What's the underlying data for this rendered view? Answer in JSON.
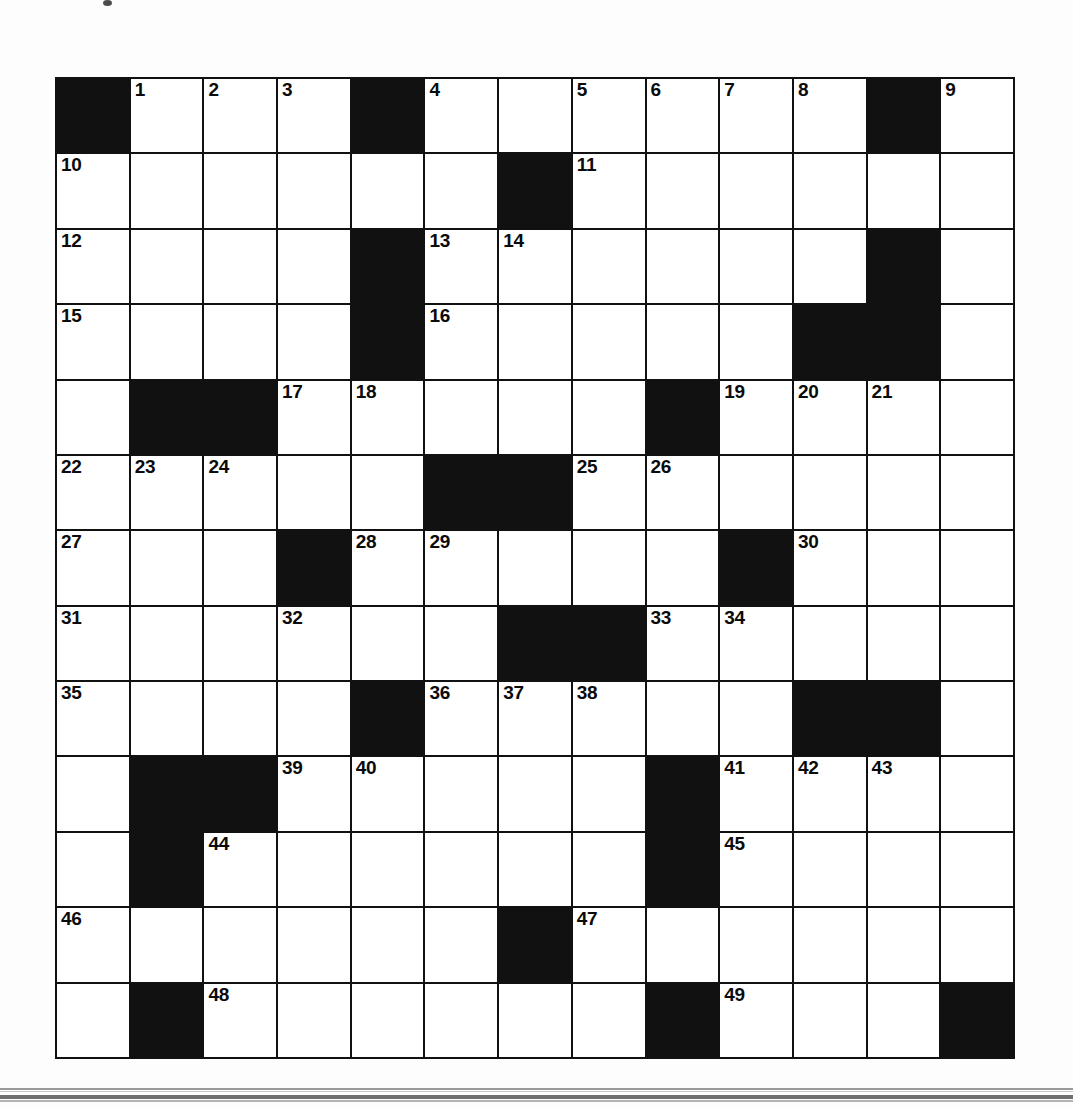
{
  "page": {
    "kind": "crossword-puzzle-grid",
    "background_color": "#fdfdfd"
  },
  "crossword": {
    "rows": 13,
    "columns": 13,
    "block_color": "#111111",
    "cell_color": "#ffffff",
    "line_color": "#111111",
    "highest_clue_number": 49,
    "grid": [
      [
        {
          "block": true
        },
        {
          "number": "1"
        },
        {
          "number": "2"
        },
        {
          "number": "3"
        },
        {
          "block": true
        },
        {
          "number": "4"
        },
        {},
        {
          "number": "5"
        },
        {
          "number": "6"
        },
        {
          "number": "7"
        },
        {
          "number": "8"
        },
        {
          "block": true
        },
        {
          "number": "9"
        }
      ],
      [
        {
          "number": "10"
        },
        {},
        {},
        {},
        {},
        {},
        {
          "block": true
        },
        {
          "number": "11"
        },
        {},
        {},
        {},
        {},
        {}
      ],
      [
        {
          "number": "12"
        },
        {},
        {},
        {},
        {
          "block": true
        },
        {
          "number": "13"
        },
        {
          "number": "14"
        },
        {},
        {},
        {},
        {},
        {
          "block": true
        },
        {}
      ],
      [
        {
          "number": "15"
        },
        {},
        {},
        {},
        {
          "block": true
        },
        {
          "number": "16"
        },
        {},
        {},
        {},
        {},
        {
          "block": true
        },
        {
          "block": true
        },
        {}
      ],
      [
        {},
        {
          "block": true
        },
        {
          "block": true
        },
        {
          "number": "17"
        },
        {
          "number": "18"
        },
        {},
        {},
        {},
        {
          "block": true
        },
        {
          "number": "19"
        },
        {
          "number": "20"
        },
        {
          "number": "21"
        },
        {}
      ],
      [
        {
          "number": "22"
        },
        {
          "number": "23"
        },
        {
          "number": "24"
        },
        {},
        {},
        {
          "block": true
        },
        {
          "block": true
        },
        {
          "number": "25"
        },
        {
          "number": "26"
        },
        {},
        {},
        {},
        {}
      ],
      [
        {
          "number": "27"
        },
        {},
        {},
        {
          "block": true
        },
        {
          "number": "28"
        },
        {
          "number": "29"
        },
        {},
        {},
        {},
        {
          "block": true
        },
        {
          "number": "30"
        },
        {},
        {}
      ],
      [
        {
          "number": "31"
        },
        {},
        {},
        {
          "number": "32"
        },
        {},
        {},
        {
          "block": true
        },
        {
          "block": true
        },
        {
          "number": "33"
        },
        {
          "number": "34"
        },
        {},
        {},
        {}
      ],
      [
        {
          "number": "35"
        },
        {},
        {},
        {},
        {
          "block": true
        },
        {
          "number": "36"
        },
        {
          "number": "37"
        },
        {
          "number": "38"
        },
        {},
        {},
        {
          "block": true
        },
        {
          "block": true
        },
        {}
      ],
      [
        {},
        {
          "block": true
        },
        {
          "block": true
        },
        {
          "number": "39"
        },
        {
          "number": "40"
        },
        {},
        {},
        {},
        {
          "block": true
        },
        {
          "number": "41"
        },
        {
          "number": "42"
        },
        {
          "number": "43"
        },
        {}
      ],
      [
        {},
        {
          "block": true
        },
        {
          "number": "44"
        },
        {},
        {},
        {},
        {},
        {},
        {
          "block": true
        },
        {
          "number": "45"
        },
        {},
        {},
        {}
      ],
      [
        {
          "number": "46"
        },
        {},
        {},
        {},
        {},
        {},
        {
          "block": true
        },
        {
          "number": "47"
        },
        {},
        {},
        {},
        {},
        {}
      ],
      [
        {},
        {
          "block": true
        },
        {
          "number": "48"
        },
        {},
        {},
        {},
        {},
        {},
        {
          "block": true
        },
        {
          "number": "49"
        },
        {},
        {},
        {
          "block": true
        }
      ]
    ]
  }
}
